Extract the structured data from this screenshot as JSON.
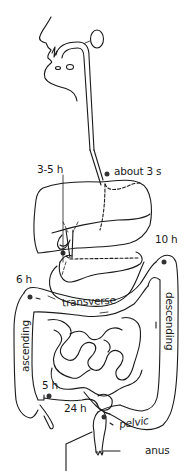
{
  "diagram": {
    "labels": {
      "esophagus_time": "about 3 s",
      "stomach_time": "3-5 h",
      "hepatic_flexure_time": "6 h",
      "splenic_flexure_time": "10 h",
      "cecum_time": "5 h",
      "rectum_time": "24 h",
      "transverse": "transverse",
      "descending": "descending",
      "ascending": "ascending",
      "pelvic": "pelvic",
      "anus": "anus"
    },
    "colors": {
      "line": "#1a1a1a",
      "marker": "#333333",
      "background": "#ffffff"
    }
  }
}
